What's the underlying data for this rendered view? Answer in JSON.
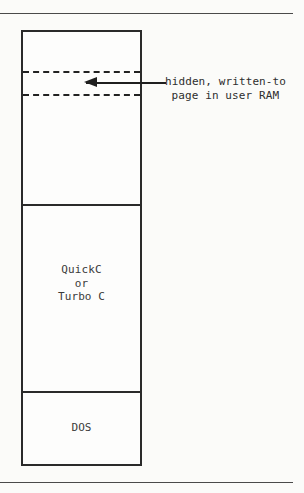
{
  "figure": {
    "type": "memory-map-diagram",
    "title": "",
    "annotation": {
      "line_1": "hidden, written-to",
      "line_2": "page in user RAM"
    },
    "regions": [
      {
        "id": "upper-user-ram",
        "label": "",
        "contains_hidden_page": true
      },
      {
        "id": "compiler",
        "label_lines": [
          "QuickC",
          "or",
          "Turbo C"
        ],
        "label_line_1": "QuickC",
        "label_line_2": "or",
        "label_line_3": "Turbo C"
      },
      {
        "id": "dos",
        "label": "DOS"
      }
    ],
    "colors": {
      "ink": "#2a2a2a",
      "text": "#3a3a3a",
      "rule": "#4a4a4a",
      "page_background": "#fbfbf9",
      "box_fill": "#fdfdfc"
    }
  }
}
